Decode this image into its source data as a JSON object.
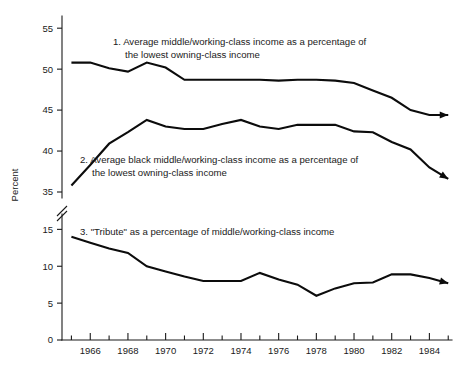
{
  "chart_data": {
    "type": "line",
    "title": "",
    "xlabel": "",
    "ylabel": "Percent",
    "grid": false,
    "legend_position": "inline-annotations",
    "axis_break": {
      "present": true,
      "between": [
        35,
        15
      ],
      "note": "broken y-axis between 35 and 15"
    },
    "x": [
      1965,
      1966,
      1967,
      1968,
      1969,
      1970,
      1971,
      1972,
      1973,
      1974,
      1975,
      1976,
      1977,
      1978,
      1979,
      1980,
      1981,
      1982,
      1983,
      1984,
      1985
    ],
    "xlim": [
      1964.5,
      1985.2
    ],
    "xticks": [
      1965,
      1966,
      1967,
      1968,
      1969,
      1970,
      1971,
      1972,
      1973,
      1974,
      1975,
      1976,
      1977,
      1978,
      1979,
      1980,
      1981,
      1982,
      1983,
      1984,
      1985
    ],
    "xtick_labels": [
      "",
      "1966",
      "",
      "1968",
      "",
      "1970",
      "",
      "1972",
      "",
      "1974",
      "",
      "1976",
      "",
      "1978",
      "",
      "1980",
      "",
      "1982",
      "",
      "1984",
      ""
    ],
    "upper_panel": {
      "ylim": [
        35,
        56
      ],
      "yticks": [
        35,
        40,
        45,
        50,
        55
      ],
      "ytick_labels": [
        "35",
        "40",
        "45",
        "50",
        "55"
      ]
    },
    "lower_panel": {
      "ylim": [
        0,
        16
      ],
      "yticks": [
        0,
        5,
        10,
        15
      ],
      "ytick_labels": [
        "0",
        "5",
        "10",
        "15"
      ]
    },
    "series": [
      {
        "name": "1. Average middle/working-class income as a percentage of the lowest owning-class income",
        "panel": "upper",
        "arrow_end": true,
        "values": [
          50.8,
          50.8,
          50.1,
          49.7,
          50.8,
          50.2,
          48.7,
          48.7,
          48.7,
          48.7,
          48.7,
          48.6,
          48.7,
          48.7,
          48.6,
          48.3,
          47.4,
          46.5,
          45.0,
          44.4,
          44.4
        ]
      },
      {
        "name": "2. Average black middle/working-class income as a percentage of the lowest owning-class income",
        "panel": "upper",
        "arrow_end": true,
        "values": [
          35.8,
          38.3,
          40.9,
          42.3,
          43.8,
          43.0,
          42.7,
          42.7,
          43.3,
          43.8,
          43.0,
          42.7,
          43.2,
          43.2,
          43.2,
          42.4,
          42.3,
          41.1,
          40.2,
          38.0,
          36.6
        ]
      },
      {
        "name": "3. \"Tribute\" as a percentage of middle/working-class income",
        "panel": "lower",
        "arrow_end": true,
        "values": [
          14.0,
          13.2,
          12.4,
          11.8,
          10.0,
          9.3,
          8.6,
          8.0,
          8.0,
          8.0,
          9.1,
          8.2,
          7.5,
          6.0,
          7.0,
          7.7,
          7.8,
          8.9,
          8.9,
          8.4,
          7.7
        ]
      }
    ],
    "annotations": [
      {
        "id": "annotation-1",
        "lines": [
          "1. Average middle/working-class income as a percentage of",
          "the lowest owning-class income"
        ]
      },
      {
        "id": "annotation-2",
        "lines": [
          "2. Average black middle/working-class income as a percentage of",
          "the lowest owning-class income"
        ]
      },
      {
        "id": "annotation-3",
        "lines": [
          "3. \"Tribute\" as a percentage of middle/working-class income"
        ]
      }
    ],
    "colors": {
      "line": "#0c0c0c",
      "axis": "#1a1a1a",
      "background": "#ffffff",
      "text": "#1a1a1a"
    }
  }
}
